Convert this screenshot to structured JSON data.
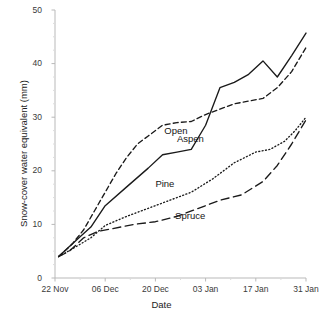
{
  "chart_data": {
    "type": "line",
    "title": "",
    "xlabel": "Date",
    "ylabel": "Snow-cover water equivalent (mm)",
    "xlim": [
      0,
      70
    ],
    "ylim": [
      0,
      50
    ],
    "yticks": [
      0,
      10,
      20,
      30,
      40,
      50
    ],
    "ytick_labels": [
      "0",
      "10",
      "20",
      "30",
      "40",
      "50"
    ],
    "xticks": [
      0,
      14,
      28,
      42,
      56,
      70
    ],
    "xtick_labels": [
      "22 Nov",
      "06 Dec",
      "20 Dec",
      "03 Jan",
      "17 Jan",
      "31 Jan"
    ],
    "grid": false,
    "legend": "inline-annotations",
    "x_unit": "days since 22 Nov",
    "series": [
      {
        "name": "Open",
        "style": "dashed",
        "color": "#1a1a1a",
        "label_x": 30.5,
        "label_y": 27.5,
        "x": [
          1,
          3,
          5,
          8,
          11,
          14,
          17,
          20,
          23,
          26,
          30,
          34,
          38,
          42,
          46,
          50,
          54,
          58,
          62,
          66,
          70
        ],
        "y": [
          4.0,
          5.2,
          6.5,
          9.0,
          12.5,
          16.0,
          19.5,
          22.5,
          25.0,
          26.5,
          28.5,
          29.0,
          29.2,
          30.5,
          31.5,
          32.5,
          33.0,
          33.5,
          35.5,
          38.5,
          43.0
        ]
      },
      {
        "name": "Aspen",
        "style": "solid",
        "color": "#1a1a1a",
        "label_x": 34.0,
        "label_y": 26.0,
        "x": [
          1,
          5,
          10,
          14,
          20,
          26,
          30,
          34,
          38,
          42,
          46,
          50,
          54,
          58,
          62,
          66,
          70
        ],
        "y": [
          4.0,
          6.5,
          9.5,
          13.5,
          17.0,
          20.5,
          23.0,
          23.5,
          24.0,
          28.5,
          35.5,
          36.5,
          38.0,
          40.5,
          37.5,
          41.5,
          45.7
        ]
      },
      {
        "name": "Pine",
        "style": "dotted",
        "color": "#1a1a1a",
        "label_x": 28.0,
        "label_y": 17.5,
        "x": [
          1,
          5,
          10,
          14,
          20,
          26,
          32,
          38,
          44,
          50,
          56,
          60,
          64,
          67,
          70
        ],
        "y": [
          4.0,
          5.5,
          7.5,
          9.8,
          11.5,
          13.0,
          14.5,
          16.0,
          18.5,
          21.5,
          23.5,
          24.0,
          25.5,
          27.5,
          30.0
        ]
      },
      {
        "name": "Spruce",
        "style": "longdash",
        "color": "#1a1a1a",
        "label_x": 33.5,
        "label_y": 11.5,
        "x": [
          1,
          4,
          8,
          12,
          16,
          22,
          28,
          34,
          40,
          46,
          52,
          58,
          62,
          66,
          70
        ],
        "y": [
          4.0,
          5.0,
          7.5,
          8.7,
          9.2,
          10.0,
          10.5,
          11.5,
          13.0,
          14.5,
          15.5,
          18.0,
          21.0,
          25.0,
          29.5
        ]
      }
    ]
  },
  "axes": {
    "line_color": "#b9b9b9",
    "tick_color": "#b9b9b9"
  }
}
